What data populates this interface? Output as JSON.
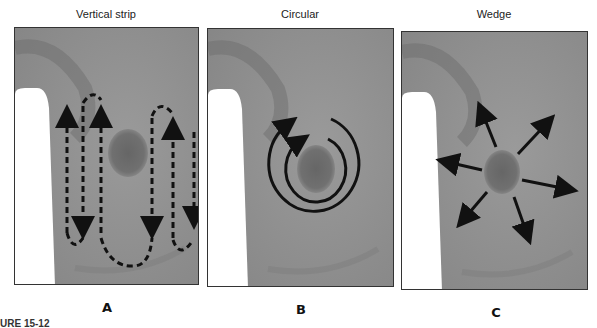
{
  "figure": {
    "caption_fragment": "URE 15-12",
    "panels": [
      {
        "id": "A",
        "title": "Vertical strip",
        "letter": "A",
        "pattern": "vertical-strip",
        "arrow_style": "dashed"
      },
      {
        "id": "B",
        "title": "Circular",
        "letter": "B",
        "pattern": "circular",
        "arrow_style": "solid"
      },
      {
        "id": "C",
        "title": "Wedge",
        "letter": "C",
        "pattern": "wedge",
        "arrow_style": "solid"
      }
    ],
    "colors": {
      "skin_gray": "#8f8f8f",
      "shadow_gray": "#6e6e6e",
      "lump": "#6a6a6a",
      "arrow": "#111111",
      "border": "#333333",
      "background": "#ffffff"
    }
  }
}
